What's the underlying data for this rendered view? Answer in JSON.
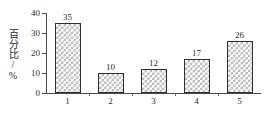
{
  "chart_data": {
    "type": "bar",
    "title": "",
    "subtitle": "",
    "xlabel": "",
    "ylabel": "百分比/%",
    "categories": [
      "1",
      "2",
      "3",
      "4",
      "5"
    ],
    "values": [
      35,
      10,
      12,
      17,
      26
    ],
    "data_labels": [
      "35",
      "10",
      "12",
      "17",
      "26"
    ],
    "ylim": [
      0,
      40
    ],
    "yticks": [
      0,
      10,
      20,
      30,
      40
    ],
    "ytick_labels": [
      "0",
      "10",
      "20",
      "30",
      "40"
    ],
    "grid": false,
    "legend": null,
    "legend_position": "none",
    "bar_fill_pattern": "checkerboard-hatch",
    "bar_fill_color": "#b9b9b9",
    "bar_border_color": "#2e2e2e",
    "axis_color": "#4a4a4a",
    "background_color": "#ffffff",
    "text_color": "#2a2a2a"
  }
}
